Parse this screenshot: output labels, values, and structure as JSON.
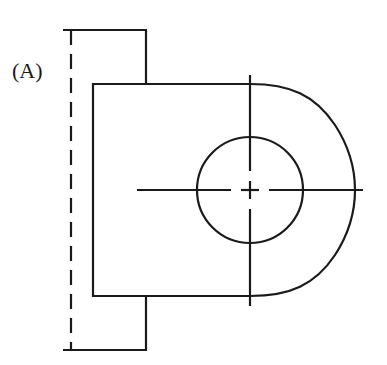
{
  "figure": {
    "label": "(A)",
    "stroke_color": "#1a1a1a",
    "background": "#ffffff",
    "stroke_width": 2.2
  },
  "geometry": {
    "side_view": {
      "top_line": {
        "x1": 63,
        "y1": 30,
        "x2": 146,
        "y2": 30
      },
      "right_top_vertical": {
        "x1": 146,
        "y1": 30,
        "x2": 146,
        "y2": 84
      },
      "bottom_line": {
        "x1": 63,
        "y1": 350,
        "x2": 146,
        "y2": 350
      },
      "right_bottom_vertical": {
        "x1": 146,
        "y1": 296,
        "x2": 146,
        "y2": 350
      },
      "hidden_edge": {
        "x": 71,
        "y1": 30,
        "y2": 350,
        "dash": "15,9"
      }
    },
    "front_view": {
      "left": 93,
      "top": 84,
      "bottom": 296,
      "arc_start_x": 250,
      "arc_control_right": 355,
      "hole": {
        "cx": 250,
        "cy": 190,
        "r": 53
      }
    },
    "centerlines": {
      "horizontal": {
        "y": 190,
        "x1": 137,
        "x2": 363
      },
      "vertical": {
        "x": 250,
        "y1": 75,
        "y2": 306
      }
    }
  }
}
